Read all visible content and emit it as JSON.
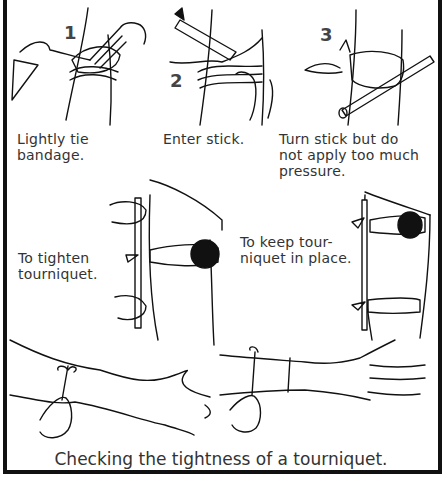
{
  "figure": {
    "title": "Checking the tightness of a tourniquet.",
    "steps": [
      {
        "number": "1",
        "caption": "Lightly tie\nbandage."
      },
      {
        "number": "2",
        "caption": "Enter stick."
      },
      {
        "number": "3",
        "caption": "Turn stick but do\nnot apply too much\npressure."
      }
    ],
    "middle_captions": [
      {
        "text": "To tighten\ntourniquet."
      },
      {
        "text": "To keep tour-\nniquet in place."
      }
    ],
    "colors": {
      "line": "#111111",
      "text": "#333333",
      "background": "#ffffff"
    }
  }
}
